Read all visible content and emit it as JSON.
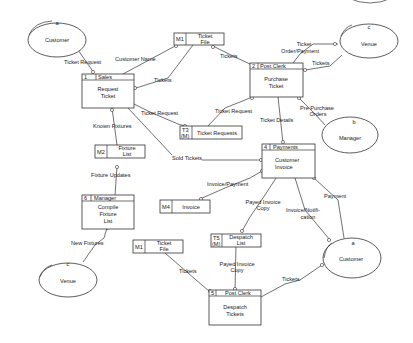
{
  "diagram": {
    "type": "data-flow-diagram",
    "external_entities": [
      {
        "id": "a",
        "label": "Customer",
        "position": "top-left"
      },
      {
        "id": "c",
        "label": "Venue",
        "position": "top-right"
      },
      {
        "id": "b",
        "label": "Manager",
        "position": "right"
      },
      {
        "id": "c",
        "label": "Venue",
        "position": "bottom-left"
      },
      {
        "id": "a",
        "label": "Customer",
        "position": "bottom-right"
      }
    ],
    "processes": [
      {
        "number": "1",
        "actor": "Sales",
        "label_line1": "Request",
        "label_line2": "Ticket",
        "label_line3": ""
      },
      {
        "number": "2",
        "actor": "Post Clerk",
        "label_line1": "Purchase",
        "label_line2": "Ticket",
        "label_line3": ""
      },
      {
        "number": "4",
        "actor": "Payments",
        "label_line1": "Customer",
        "label_line2": "Invoice",
        "label_line3": ""
      },
      {
        "number": "6",
        "actor": "Manager",
        "label_line1": "Compile",
        "label_line2": "Fixture",
        "label_line3": "List"
      },
      {
        "number": "5",
        "actor": "Post Clerk",
        "label_line1": "Despatch",
        "label_line2": "Tickets",
        "label_line3": ""
      }
    ],
    "data_stores": [
      {
        "id": "M1",
        "line1": "Ticket",
        "line2": "File",
        "position": "top"
      },
      {
        "id_line1": "T3",
        "id_line2": "(M)",
        "line1": "Ticket Requests"
      },
      {
        "id": "M2",
        "line1": "Fixture",
        "line2": "List"
      },
      {
        "id": "M4",
        "line1": "Invoice"
      },
      {
        "id_line1": "T5",
        "id_line2": "(M)",
        "line1": "Despatch",
        "line2": "List"
      },
      {
        "id": "M1",
        "line1": "Ticket",
        "line2": "File",
        "position": "bottom"
      }
    ],
    "flows": {
      "ticket_request_1": "Ticket Request",
      "customer_name": "Customer Name",
      "tickets_m1_to_1": "Tickets",
      "tickets_2_to_m1": "Tickets",
      "ticket_order_payment_line1": "Ticket",
      "ticket_order_payment_line2": "Order/Payment",
      "tickets_venue": "Tickets",
      "ticket_request_to_t3": "Ticket Request",
      "ticket_request_t3_to_2": "Ticket Request",
      "known_fixtures": "Known Fixtures",
      "ticket_details": "Ticket Details",
      "pre_purchase_line1": "Pre Purchase",
      "pre_purchase_line2": "Orders",
      "fixture_updates": "Fixture Updates",
      "sold_tickets": "Sold Tickets",
      "invoice_payment": "Invoice/Payment",
      "payed_invoice_copy_1_line1": "Payed Invoice",
      "payed_invoice_copy_1_line2": "Copy",
      "invoice_notification_line1": "Invoice/Notifi-",
      "invoice_notification_line2": "cation",
      "payment": "Payment",
      "new_fixtures": "New Fixtures",
      "tickets_m1_to_5": "Tickets",
      "payed_invoice_copy_2_line1": "Payed Invoice",
      "payed_invoice_copy_2_line2": "Copy",
      "tickets_5_to_customer": "Tickets"
    }
  }
}
